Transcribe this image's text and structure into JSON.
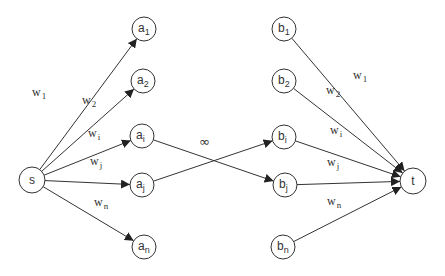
{
  "diagram": {
    "type": "flow-network",
    "colors": {
      "stroke": "#333333",
      "background": "#ffffff"
    },
    "nodes": {
      "s": {
        "label": "s",
        "sub": "",
        "x": 32,
        "y": 180
      },
      "a1": {
        "label": "a",
        "sub": "1",
        "x": 144,
        "y": 29
      },
      "a2": {
        "label": "a",
        "sub": "2",
        "x": 143,
        "y": 81
      },
      "ai": {
        "label": "a",
        "sub": "i",
        "x": 142,
        "y": 136
      },
      "aj": {
        "label": "a",
        "sub": "j",
        "x": 142,
        "y": 185
      },
      "an": {
        "label": "a",
        "sub": "n",
        "x": 144,
        "y": 247
      },
      "b1": {
        "label": "b",
        "sub": "1",
        "x": 284,
        "y": 29
      },
      "b2": {
        "label": "b",
        "sub": "2",
        "x": 284,
        "y": 81
      },
      "bi": {
        "label": "b",
        "sub": "i",
        "x": 284,
        "y": 137
      },
      "bj": {
        "label": "b",
        "sub": "j",
        "x": 285,
        "y": 185
      },
      "bn": {
        "label": "b",
        "sub": "n",
        "x": 283,
        "y": 247
      },
      "t": {
        "label": "t",
        "sub": "",
        "x": 413,
        "y": 181
      }
    },
    "edges": [
      {
        "from": "s",
        "to": "a1",
        "label": "w",
        "sub": "1",
        "lx": 32,
        "ly": 96
      },
      {
        "from": "s",
        "to": "a2",
        "label": "w",
        "sub": "2",
        "lx": 82,
        "ly": 104
      },
      {
        "from": "s",
        "to": "ai",
        "label": "w",
        "sub": "i",
        "lx": 88,
        "ly": 137
      },
      {
        "from": "s",
        "to": "aj",
        "label": "w",
        "sub": "j",
        "lx": 90,
        "ly": 165
      },
      {
        "from": "s",
        "to": "an",
        "label": "w",
        "sub": "n",
        "lx": 94,
        "ly": 206
      },
      {
        "from": "ai",
        "to": "bj",
        "label": "",
        "sub": ""
      },
      {
        "from": "aj",
        "to": "bi",
        "label": "",
        "sub": ""
      },
      {
        "from": "b1",
        "to": "t",
        "label": "w",
        "sub": "1",
        "lx": 353,
        "ly": 79
      },
      {
        "from": "b2",
        "to": "t",
        "label": "w",
        "sub": "2",
        "lx": 326,
        "ly": 94
      },
      {
        "from": "bi",
        "to": "t",
        "label": "w",
        "sub": "i",
        "lx": 330,
        "ly": 134
      },
      {
        "from": "bj",
        "to": "t",
        "label": "w",
        "sub": "j",
        "lx": 327,
        "ly": 166
      },
      {
        "from": "bn",
        "to": "t",
        "label": "w",
        "sub": "n",
        "lx": 327,
        "ly": 205
      }
    ],
    "infinity_label": {
      "text": "∞",
      "x": 199,
      "y": 146
    }
  }
}
